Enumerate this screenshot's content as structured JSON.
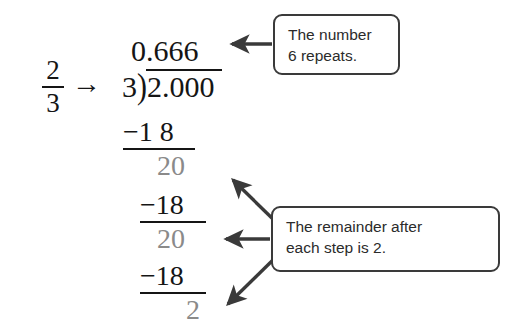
{
  "figure": {
    "background_color": "#ffffff",
    "ink_color": "#151515",
    "muted_color": "#8a8a8a",
    "callout_border_color": "#3a3a3a"
  },
  "fraction": {
    "numerator": "2",
    "denominator": "3",
    "arrow_glyph": "→"
  },
  "division": {
    "quotient": "0.666",
    "divisor": "3",
    "bracket_glyph": ")",
    "dividend": "2.000",
    "steps": [
      {
        "subtract": "−1 8",
        "remainder": "20"
      },
      {
        "subtract": "−18",
        "remainder": "20"
      },
      {
        "subtract": "−18",
        "remainder": "2"
      }
    ]
  },
  "callouts": [
    {
      "id": "repeats",
      "line1": "The number",
      "line2": "6 repeats.",
      "arrows": 1
    },
    {
      "id": "remainder",
      "line1": "The remainder after",
      "line2": "each step is 2.",
      "arrows": 3
    }
  ]
}
